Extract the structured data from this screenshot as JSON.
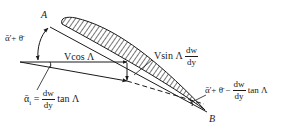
{
  "diagram": {
    "type": "swept-wing velocity and angle decomposition",
    "points": {
      "A": "A",
      "B": "B"
    },
    "labels": {
      "angle_top": "ᾱ'+ θ̄",
      "v_cos": "Vcos Λ",
      "v_sin_prefix": "Vsin Λ",
      "v_sin_frac_num": "dw",
      "v_sin_frac_den": "dy",
      "alpha_i_lhs": "ᾱ",
      "alpha_i_sub": "i",
      "alpha_i_eq": "=",
      "alpha_i_frac_num": "dw",
      "alpha_i_frac_den": "dy",
      "alpha_i_tail": "tan Λ",
      "angle_b_prefix": "ᾱ'+ θ̄ −",
      "angle_b_frac_num": "dw",
      "angle_b_frac_den": "dy",
      "angle_b_tail": "tan Λ"
    },
    "colors": {
      "ink": "#1a1a1a",
      "background": "#ffffff"
    }
  }
}
